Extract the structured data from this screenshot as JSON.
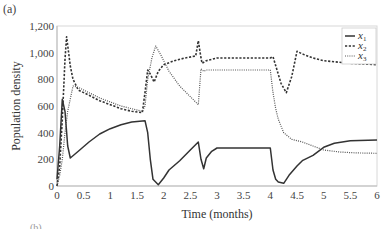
{
  "panel_label": "(a)",
  "next_panel_label": "(b)",
  "chart_data": {
    "type": "line",
    "title": "",
    "xlabel": "Time (months)",
    "ylabel": "Population density",
    "xlim": [
      0,
      6
    ],
    "ylim": [
      0,
      1200
    ],
    "xticks": [
      0,
      0.5,
      1,
      1.5,
      2,
      2.5,
      3,
      3.5,
      4,
      4.5,
      5,
      5.5,
      6
    ],
    "xtick_labels": [
      "0",
      "0.5",
      "1",
      "1.5",
      "2",
      "2.5",
      "3",
      "3.5",
      "4",
      "4.5",
      "5",
      "5.5",
      "6"
    ],
    "yticks": [
      0,
      200,
      400,
      600,
      800,
      1000,
      1200
    ],
    "ytick_labels": [
      "0",
      "200",
      "400",
      "600",
      "800",
      "1,000",
      "1,200"
    ],
    "grid": false,
    "legend_position": "upper right",
    "series": [
      {
        "name": "x1",
        "label": "x",
        "subscript": "1",
        "style": "solid",
        "color": "#333333",
        "x": [
          0,
          0.05,
          0.1,
          0.15,
          0.2,
          0.25,
          0.4,
          0.6,
          0.8,
          1.0,
          1.2,
          1.4,
          1.65,
          1.7,
          1.75,
          1.8,
          1.9,
          2.0,
          2.1,
          2.3,
          2.5,
          2.65,
          2.7,
          2.75,
          2.8,
          2.9,
          3.0,
          3.5,
          4.0,
          4.05,
          4.1,
          4.15,
          4.25,
          4.35,
          4.5,
          4.6,
          4.8,
          5.0,
          5.2,
          5.5,
          6.0
        ],
        "y": [
          50,
          300,
          650,
          560,
          300,
          210,
          260,
          330,
          390,
          430,
          460,
          480,
          490,
          400,
          200,
          50,
          10,
          60,
          120,
          190,
          270,
          330,
          200,
          130,
          210,
          260,
          285,
          285,
          285,
          120,
          50,
          30,
          20,
          80,
          150,
          190,
          230,
          290,
          320,
          340,
          345
        ]
      },
      {
        "name": "x2",
        "label": "x",
        "subscript": "2",
        "style": "dashed",
        "color": "#333333",
        "x": [
          0,
          0.05,
          0.1,
          0.15,
          0.18,
          0.25,
          0.3,
          0.4,
          0.6,
          0.8,
          1.0,
          1.2,
          1.4,
          1.6,
          1.65,
          1.7,
          1.75,
          1.82,
          1.9,
          2.0,
          2.2,
          2.4,
          2.6,
          2.65,
          2.7,
          2.72,
          2.8,
          3.0,
          3.5,
          4.0,
          4.05,
          4.2,
          4.3,
          4.4,
          4.5,
          4.6,
          4.8,
          5.0,
          5.5,
          6.0
        ],
        "y": [
          0,
          150,
          500,
          950,
          1120,
          900,
          800,
          720,
          680,
          640,
          610,
          580,
          560,
          550,
          700,
          870,
          840,
          780,
          860,
          910,
          940,
          960,
          975,
          1090,
          960,
          920,
          940,
          960,
          960,
          960,
          970,
          770,
          700,
          820,
          1010,
          990,
          960,
          940,
          920,
          910
        ]
      },
      {
        "name": "x3",
        "label": "x",
        "subscript": "3",
        "style": "dotted",
        "color": "#555555",
        "x": [
          0,
          0.05,
          0.1,
          0.15,
          0.2,
          0.3,
          0.4,
          0.6,
          0.8,
          1.0,
          1.2,
          1.4,
          1.6,
          1.65,
          1.7,
          1.78,
          1.85,
          1.95,
          2.1,
          2.3,
          2.5,
          2.65,
          2.7,
          2.75,
          2.8,
          3.0,
          3.5,
          4.0,
          4.05,
          4.1,
          4.15,
          4.25,
          4.4,
          4.6,
          4.8,
          5.0,
          5.3,
          5.6,
          6.0
        ],
        "y": [
          0,
          80,
          200,
          400,
          560,
          750,
          740,
          700,
          660,
          630,
          600,
          580,
          560,
          600,
          800,
          960,
          1050,
          980,
          860,
          750,
          670,
          610,
          880,
          860,
          870,
          870,
          870,
          870,
          700,
          580,
          500,
          400,
          350,
          330,
          300,
          270,
          255,
          248,
          245
        ]
      }
    ]
  }
}
